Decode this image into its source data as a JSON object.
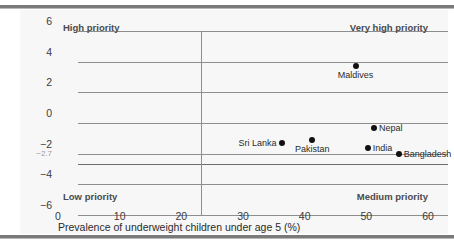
{
  "chart_data": {
    "type": "scatter",
    "title": "",
    "xlabel": "Prevalence of underweight children under age 5 (%)",
    "ylabel": "",
    "xlim": [
      0,
      60
    ],
    "ylim": [
      -6,
      6
    ],
    "xticks": [
      "0",
      "10",
      "20",
      "30",
      "40",
      "50",
      "60"
    ],
    "xtick_values": [
      0,
      10,
      20,
      30,
      40,
      50,
      60
    ],
    "yticks": [
      "6",
      "4",
      "2",
      "0",
      "−2",
      "−4",
      "−6"
    ],
    "ytick_values": [
      6,
      4,
      2,
      0,
      -2,
      -4,
      -6
    ],
    "minor_ytick_label": "−2.7",
    "minor_ytick_value": -2.7,
    "grid": true,
    "legend": "none",
    "reference_lines": {
      "vertical_x": 20,
      "horizontal_y": -2.7
    },
    "quadrant_labels": [
      {
        "text": "High priority",
        "corner": "top-left"
      },
      {
        "text": "Very high priority",
        "corner": "top-right"
      },
      {
        "text": "Low priority",
        "corner": "bottom-left"
      },
      {
        "text": "Medium priority",
        "corner": "bottom-right"
      }
    ],
    "points": [
      {
        "name": "Maldives",
        "x": 45,
        "y": 3.7,
        "label_pos": "below"
      },
      {
        "name": "Nepal",
        "x": 48,
        "y": -0.3,
        "label_pos": "right"
      },
      {
        "name": "Sri Lanka",
        "x": 33,
        "y": -1.3,
        "label_pos": "left"
      },
      {
        "name": "Pakistan",
        "x": 38,
        "y": -1.1,
        "label_pos": "below"
      },
      {
        "name": "India",
        "x": 47,
        "y": -1.6,
        "label_pos": "right"
      },
      {
        "name": "Bangladesh",
        "x": 52,
        "y": -2.0,
        "label_pos": "right"
      }
    ],
    "colors": {
      "point": "#111111",
      "grid": "#8e8e8e",
      "reference": "#6e6e6e",
      "text": "#2a2a2a",
      "panel_background": "#f7f7f7",
      "rule": "#7a7a7a"
    }
  }
}
